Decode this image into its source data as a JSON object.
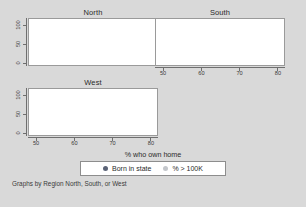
{
  "figure": {
    "background_color": "#d9d9d9",
    "panel_background_color": "#ffffff",
    "caption": "Graphs by Region North, South, or West",
    "xtitle": "% who own home"
  },
  "legend": {
    "entries": [
      {
        "label": "Born in state",
        "color": "#5b6377",
        "marker": "filled-circle"
      },
      {
        "label": "% > 100K",
        "color": "#c3c6cb",
        "marker": "filled-circle"
      }
    ]
  },
  "chart_data": {
    "type": "scatter",
    "title": "",
    "xlabel": "% who own home",
    "ylabel": "",
    "xlim": [
      48,
      82
    ],
    "ylim": [
      -8,
      112
    ],
    "xticks": [
      50,
      60,
      70,
      80
    ],
    "yticks": [
      0,
      50,
      100
    ],
    "grid": false,
    "legend_position": "bottom",
    "panel_by": "Region North, South, or West",
    "panels": [
      {
        "name": "North",
        "title": "North",
        "series": [
          {
            "name": "Born in state",
            "color": "#5b6377",
            "points": [
              [
                61.0,
                68.0
              ],
              [
                62.6,
                71.0
              ],
              [
                63.0,
                65.0
              ],
              [
                62.2,
                67.0
              ],
              [
                67.5,
                62.0
              ],
              [
                68.2,
                70.0
              ],
              [
                69.0,
                57.0
              ],
              [
                69.6,
                71.0
              ],
              [
                70.2,
                66.0
              ],
              [
                70.8,
                73.0
              ],
              [
                71.2,
                60.0
              ],
              [
                71.6,
                72.0
              ],
              [
                72.0,
                69.0
              ],
              [
                72.4,
                74.0
              ],
              [
                72.8,
                67.0
              ],
              [
                73.2,
                73.0
              ],
              [
                73.6,
                62.0
              ],
              [
                74.0,
                71.0
              ],
              [
                74.6,
                70.0
              ],
              [
                75.4,
                66.0
              ],
              [
                76.6,
                72.0
              ],
              [
                77.4,
                70.0
              ],
              [
                70.6,
                64.0
              ],
              [
                69.2,
                68.0
              ]
            ]
          },
          {
            "name": "% > 100K",
            "color": "#c3c6cb",
            "points": [
              [
                60.8,
                60.0
              ],
              [
                62.4,
                66.0
              ],
              [
                67.6,
                30.0
              ],
              [
                68.4,
                20.0
              ],
              [
                69.0,
                12.0
              ],
              [
                69.4,
                25.0
              ],
              [
                70.0,
                16.0
              ],
              [
                70.6,
                10.0
              ],
              [
                71.0,
                22.0
              ],
              [
                71.6,
                13.0
              ],
              [
                72.2,
                9.0
              ],
              [
                72.6,
                18.0
              ],
              [
                73.0,
                11.0
              ],
              [
                73.8,
                14.0
              ],
              [
                74.4,
                8.0
              ],
              [
                75.2,
                26.0
              ],
              [
                76.4,
                20.0
              ],
              [
                77.2,
                16.0
              ],
              [
                70.2,
                30.0
              ],
              [
                68.8,
                26.0
              ]
            ]
          }
        ]
      },
      {
        "name": "South",
        "title": "South",
        "series": [
          {
            "name": "Born in state",
            "color": "#5b6377",
            "points": [
              [
                66.0,
                66.0
              ],
              [
                68.4,
                68.0
              ],
              [
                69.2,
                73.0
              ],
              [
                70.0,
                65.0
              ],
              [
                70.6,
                74.0
              ],
              [
                71.0,
                72.0
              ],
              [
                71.4,
                73.0
              ],
              [
                71.8,
                71.0
              ],
              [
                72.2,
                74.0
              ],
              [
                72.8,
                70.0
              ],
              [
                73.6,
                72.0
              ],
              [
                74.4,
                73.0
              ],
              [
                73.0,
                56.0
              ],
              [
                74.0,
                57.0
              ],
              [
                70.4,
                58.0
              ],
              [
                69.6,
                60.0
              ]
            ]
          },
          {
            "name": "% > 100K",
            "color": "#c3c6cb",
            "points": [
              [
                67.2,
                28.0
              ],
              [
                69.4,
                34.0
              ],
              [
                70.0,
                26.0
              ],
              [
                70.6,
                41.0
              ],
              [
                71.0,
                22.0
              ],
              [
                71.4,
                32.0
              ],
              [
                71.8,
                24.0
              ],
              [
                72.2,
                18.0
              ],
              [
                72.6,
                20.0
              ],
              [
                73.0,
                16.0
              ],
              [
                73.6,
                22.0
              ],
              [
                74.2,
                14.0
              ],
              [
                74.8,
                18.0
              ],
              [
                75.4,
                16.0
              ],
              [
                70.2,
                45.0
              ],
              [
                69.0,
                24.0
              ]
            ]
          }
        ]
      },
      {
        "name": "West",
        "title": "West",
        "series": [
          {
            "name": "Born in state",
            "color": "#5b6377",
            "points": [
              [
                55.8,
                58.0
              ],
              [
                57.8,
                54.0
              ],
              [
                58.8,
                48.0
              ],
              [
                59.4,
                44.0
              ],
              [
                59.6,
                26.0
              ],
              [
                65.2,
                50.0
              ],
              [
                66.0,
                47.0
              ],
              [
                67.2,
                36.0
              ],
              [
                68.6,
                52.0
              ],
              [
                69.4,
                57.0
              ],
              [
                70.0,
                55.0
              ],
              [
                70.8,
                48.0
              ],
              [
                71.6,
                52.0
              ],
              [
                72.4,
                58.0
              ],
              [
                72.8,
                66.0
              ],
              [
                73.0,
                50.0
              ]
            ]
          },
          {
            "name": "% > 100K",
            "color": "#c3c6cb",
            "points": [
              [
                57.6,
                88.0
              ],
              [
                59.6,
                76.0
              ],
              [
                58.6,
                44.0
              ],
              [
                59.2,
                41.0
              ],
              [
                65.0,
                48.0
              ],
              [
                65.4,
                30.0
              ],
              [
                67.0,
                34.0
              ],
              [
                68.0,
                24.0
              ],
              [
                68.8,
                26.0
              ],
              [
                69.4,
                18.0
              ],
              [
                70.2,
                14.0
              ],
              [
                71.0,
                20.0
              ],
              [
                71.8,
                12.0
              ],
              [
                72.6,
                16.0
              ],
              [
                73.2,
                22.0
              ],
              [
                66.2,
                42.0
              ]
            ]
          }
        ]
      }
    ]
  }
}
